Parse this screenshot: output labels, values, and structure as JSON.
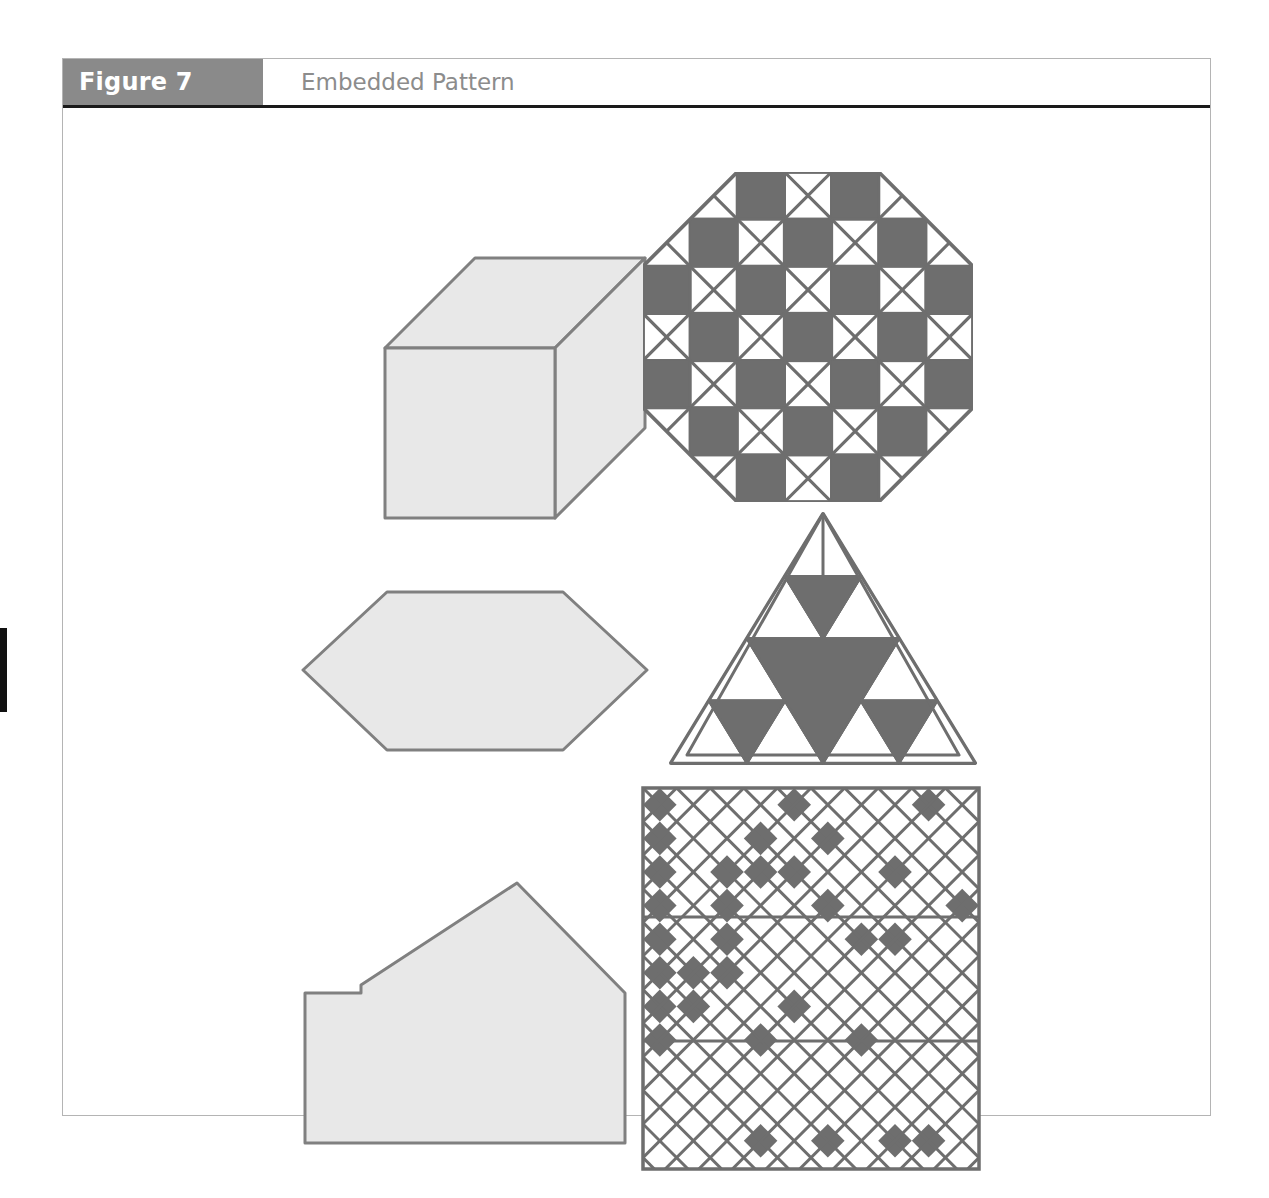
{
  "page": {
    "background_color": "#ffffff",
    "edge_tab_color": "#111111"
  },
  "figure": {
    "number_label": "Figure 7",
    "title": "Embedded Pattern",
    "number_band_color": "#8a8a8a",
    "number_text_color": "#ffffff",
    "title_text_color": "#8c8c8c",
    "rule_color": "#1a1a1a",
    "frame_border_color": "#b4b4b4"
  },
  "palette": {
    "shape_fill": "#e8e8e8",
    "shape_stroke": "#808080",
    "pattern_dark": "#6e6e6e",
    "pattern_light": "#ffffff",
    "pattern_stroke": "#6e6e6e"
  },
  "shapes": [
    {
      "id": "box-3d",
      "name": "three-dimensional-rectangular-box",
      "type": "solid-outline",
      "description": "Isometric cuboid with visible front face, top face and right face",
      "fill": "#e8e8e8",
      "stroke": "#808080",
      "front_face": "60,120 230,120 230,290 60,290",
      "top_face": "60,120 150,30 320,30 230,120",
      "right_face": "230,120 320,30 320,200 230,290"
    },
    {
      "id": "hexagon",
      "name": "elongated-hexagon",
      "type": "solid-outline",
      "description": "Wide flattened hexagon with two pointed horizontal vertices",
      "fill": "#e8e8e8",
      "stroke": "#808080",
      "points": "92,30 268,30 350,97 268,165 92,165 10,97"
    },
    {
      "id": "house-polygon",
      "name": "irregular-house-polygon",
      "type": "solid-outline",
      "description": "Seven-sided polygon resembling a house with a stepped left notch and peaked roof",
      "fill": "#e8e8e8",
      "stroke": "#808080",
      "points": "10,120 66,120 66,112 222,10 330,120 330,270 10,270"
    },
    {
      "id": "octagon-checker",
      "name": "octagon-checkerboard-pattern",
      "type": "patterned",
      "description": "Octagon built from a 7x7 checkerboard; dark solid cells alternate with white cells bearing X diagonals; four corners cut off diagonally",
      "grid_cols": 7,
      "grid_rows": 7,
      "cell_size": 45,
      "corner_cut_cells": 2,
      "dark_parity": 0
    },
    {
      "id": "sierpinski-triangle",
      "name": "subdivided-triangle-pattern",
      "type": "patterned",
      "description": "Equilateral triangle subdivided into 4 rows of smaller triangles with selected downward-pointing triangles filled dark, plus an inner nested triangle outline",
      "rows": 4,
      "dark_cells": [
        {
          "row": 1,
          "index": 1
        },
        {
          "row": 2,
          "index": 1
        },
        {
          "row": 2,
          "index": 3
        },
        {
          "row": 3,
          "index": 1
        },
        {
          "row": 3,
          "index": 3
        },
        {
          "row": 3,
          "index": 5
        }
      ]
    },
    {
      "id": "diamond-lattice-square",
      "name": "diamond-lattice-square-pattern",
      "type": "patterned",
      "description": "Square filled with a 45-degree diamond lattice; scattered diamonds are filled dark; two horizontal rules divide the square into three bands",
      "grid_cols": 10,
      "grid_rows": 12,
      "band_dividers": 2
    }
  ],
  "chart_data": {
    "type": "table",
    "title": "Embedded Pattern",
    "columns": [
      "Plain shape",
      "Patterned shape"
    ],
    "rows": [
      [
        "three-dimensional-rectangular-box",
        "octagon-checkerboard-pattern"
      ],
      [
        "elongated-hexagon",
        "subdivided-triangle-pattern"
      ],
      [
        "irregular-house-polygon",
        "diamond-lattice-square-pattern"
      ]
    ]
  }
}
